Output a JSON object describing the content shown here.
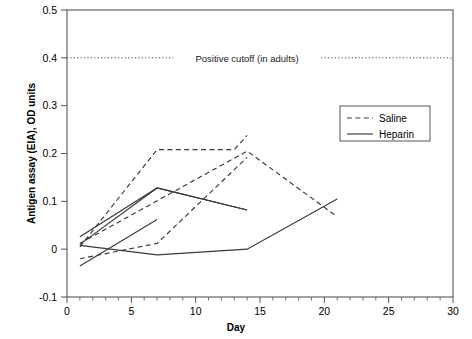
{
  "chart_data": {
    "type": "line",
    "title": "",
    "xlabel": "Day",
    "ylabel": "Antigen assay (EIA), OD units",
    "xlim": [
      0,
      30
    ],
    "ylim": [
      -0.1,
      0.5
    ],
    "xticks": [
      0,
      5,
      10,
      15,
      20,
      25,
      30
    ],
    "xtick_labels": [
      "0",
      "5",
      "10",
      "15",
      "20",
      "25",
      "30"
    ],
    "xminor_step": 1,
    "yticks": [
      -0.1,
      0,
      0.1,
      0.2,
      0.3,
      0.4,
      0.5
    ],
    "ytick_labels": [
      "-0.1",
      "0",
      "0.1",
      "0.2",
      "0.3",
      "0.4",
      "0.5"
    ],
    "grid": false,
    "annotations": [
      {
        "name": "positive-cutoff",
        "text": "Positive cutoff (in adults)",
        "y": 0.4,
        "style": "dotted-horizontal-line",
        "label_x": 14.0
      }
    ],
    "legend": {
      "position": "upper-right-inside",
      "entries": [
        {
          "name": "Saline",
          "style": "dashed"
        },
        {
          "name": "Heparin",
          "style": "solid"
        }
      ]
    },
    "series": [
      {
        "name": "Saline",
        "style": "dashed",
        "subject": "saline-1",
        "x": [
          1,
          7,
          13,
          14
        ],
        "y": [
          0.005,
          0.208,
          0.208,
          0.238
        ]
      },
      {
        "name": "Saline",
        "style": "dashed",
        "subject": "saline-2",
        "x": [
          1,
          7,
          14
        ],
        "y": [
          -0.02,
          0.012,
          0.192
        ]
      },
      {
        "name": "Saline",
        "style": "dashed",
        "subject": "saline-3",
        "x": [
          1,
          14,
          21
        ],
        "y": [
          0.012,
          0.205,
          0.068
        ]
      },
      {
        "name": "Heparin",
        "style": "solid",
        "subject": "heparin-1",
        "x": [
          1,
          7,
          14
        ],
        "y": [
          0.026,
          0.128,
          0.082
        ]
      },
      {
        "name": "Heparin",
        "style": "solid",
        "subject": "heparin-2",
        "x": [
          1,
          7
        ],
        "y": [
          -0.035,
          0.062
        ]
      },
      {
        "name": "Heparin",
        "style": "solid",
        "subject": "heparin-3",
        "x": [
          1,
          7,
          14,
          21
        ],
        "y": [
          0.008,
          -0.012,
          0.0,
          0.105
        ]
      },
      {
        "name": "Heparin",
        "style": "solid",
        "subject": "heparin-4",
        "x": [
          1,
          7,
          14
        ],
        "y": [
          0.01,
          0.128,
          0.082
        ]
      }
    ]
  }
}
